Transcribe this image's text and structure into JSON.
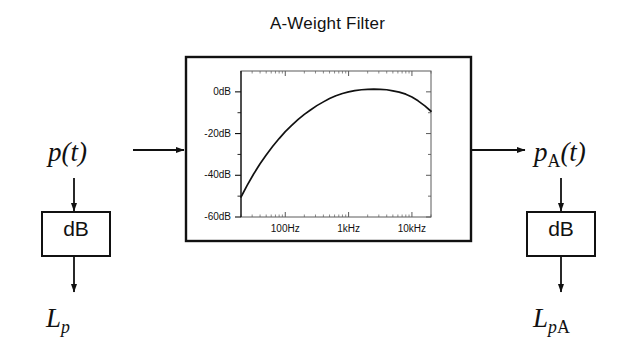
{
  "diagram": {
    "title": "A-Weight Filter",
    "input_signal": {
      "base": "p",
      "arg": "(t)",
      "full": "p(t)"
    },
    "output_signal": {
      "base": "p",
      "subscript": "A",
      "arg": "(t)",
      "full": "pA(t)"
    },
    "input_level": {
      "base": "L",
      "subscript": "p",
      "full": "Lp"
    },
    "output_level": {
      "base": "L",
      "subscript_italic": "p",
      "subscript_upright": "A",
      "full": "LpA"
    },
    "db_block_left_label": "dB",
    "db_block_right_label": "dB",
    "line_color": "#111111",
    "background_color": "#ffffff"
  },
  "chart_data": {
    "type": "line",
    "title": "A-Weight Filter",
    "xlabel": "",
    "ylabel": "",
    "xscale": "log",
    "xlim": [
      20,
      20000
    ],
    "ylim": [
      -60,
      10
    ],
    "grid": false,
    "legend": null,
    "xticks": [
      100,
      1000,
      10000
    ],
    "xtick_labels": [
      "100Hz",
      "1kHz",
      "10kHz"
    ],
    "yticks": [
      0,
      -20,
      -40,
      -60
    ],
    "ytick_labels": [
      "0dB",
      "-20dB",
      "-40dB",
      "-60dB"
    ],
    "yminor_ticks": [
      -10,
      -30,
      -50
    ],
    "series": [
      {
        "name": "A-weighting response",
        "x": [
          20,
          25,
          31.5,
          40,
          50,
          63,
          80,
          100,
          125,
          160,
          200,
          250,
          315,
          400,
          500,
          630,
          800,
          1000,
          1250,
          1600,
          2000,
          2500,
          3150,
          4000,
          5000,
          6300,
          8000,
          10000,
          12500,
          16000,
          20000
        ],
        "y": [
          -50.4,
          -44.8,
          -39.5,
          -34.5,
          -30.3,
          -26.2,
          -22.4,
          -19.1,
          -16.2,
          -13.2,
          -10.8,
          -8.7,
          -6.6,
          -4.8,
          -3.2,
          -1.9,
          -0.8,
          0.0,
          0.6,
          1.0,
          1.2,
          1.3,
          1.2,
          1.0,
          0.5,
          -0.1,
          -1.1,
          -2.5,
          -4.3,
          -6.7,
          -9.3
        ]
      }
    ]
  }
}
